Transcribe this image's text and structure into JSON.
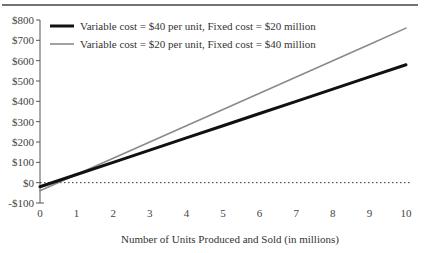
{
  "chart_data": {
    "type": "line",
    "title": "",
    "xlabel": "Number of Units Produced and Sold (in millions)",
    "ylabel": "",
    "x": [
      0,
      1,
      2,
      3,
      4,
      5,
      6,
      7,
      8,
      9,
      10
    ],
    "xlim": [
      0,
      10
    ],
    "ylim": [
      -100,
      800
    ],
    "x_ticks": [
      "0",
      "1",
      "2",
      "3",
      "4",
      "5",
      "6",
      "7",
      "8",
      "9",
      "10"
    ],
    "y_ticks": [
      "-$100",
      "$0",
      "$100",
      "$200",
      "$300",
      "$400",
      "$500",
      "$600",
      "$700",
      "$800"
    ],
    "y_tick_values": [
      -100,
      0,
      100,
      200,
      300,
      400,
      500,
      600,
      700,
      800
    ],
    "grid": false,
    "reference_line": {
      "y": 0,
      "style": "dotted"
    },
    "legend_position": "top-left",
    "series": [
      {
        "name": "Variable cost = $40 per unit, Fixed cost = $20 million",
        "color": "#111111",
        "width": 3,
        "values": [
          -20,
          40,
          100,
          160,
          220,
          280,
          340,
          400,
          460,
          520,
          580
        ]
      },
      {
        "name": "Variable cost = $20 per unit, Fixed cost = $40 million",
        "color": "#8a8a8a",
        "width": 1.6,
        "values": [
          -40,
          40,
          120,
          200,
          280,
          360,
          440,
          520,
          600,
          680,
          760
        ]
      }
    ]
  }
}
